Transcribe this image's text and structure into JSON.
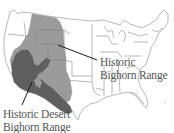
{
  "map": {
    "subject": "United States outline map",
    "regions": [
      {
        "id": "historic-bighorn",
        "label_lines": [
          "Historic",
          "Bighorn Range"
        ],
        "color": "#9b9b9b"
      },
      {
        "id": "historic-desert-bighorn",
        "label_lines": [
          "Historic Desert",
          "Bighorn Range"
        ],
        "color": "#5f5f5f"
      }
    ],
    "colors": {
      "background": "#ffffff",
      "state_borders": "#9a9a9a",
      "leader_line": "#1a1a1a",
      "label_text": "#555555"
    },
    "edge_mark": ":"
  }
}
